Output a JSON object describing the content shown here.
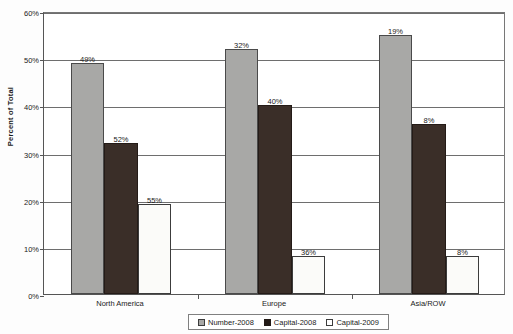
{
  "chart_data": {
    "type": "bar",
    "title": "",
    "subtitle": "",
    "xlabel": "",
    "ylabel": "Percent of Total",
    "categories": [
      "North America",
      "Europe",
      "Asia/ROW"
    ],
    "series": [
      {
        "name": "Number-2008",
        "values": [
          49,
          52,
          55
        ],
        "color": "#a8a8a6",
        "swatch": "gray-swatch"
      },
      {
        "name": "Capital-2008",
        "values": [
          32,
          40,
          36
        ],
        "color": "#3a2e28",
        "swatch": "black-swatch"
      },
      {
        "name": "Capital-2009",
        "values": [
          19,
          8,
          8
        ],
        "color": "#ffffff",
        "swatch": "white-swatch"
      }
    ],
    "grouped_values": {
      "North America": {
        "Number-2008": 49,
        "Capital-2008": 52,
        "Capital-2009": 55
      },
      "Europe": {
        "Number-2008": 32,
        "Capital-2008": 40,
        "Capital-2009": 36
      },
      "Asia/ROW": {
        "Number-2008": 19,
        "Capital-2008": 8,
        "Capital-2009": 8
      }
    },
    "data_labels": [
      [
        "49%",
        "52%",
        "55%"
      ],
      [
        "32%",
        "40%",
        "36%"
      ],
      [
        "19%",
        "8%",
        "8%"
      ]
    ],
    "ylim": [
      0,
      60
    ],
    "ytick_values": [
      0,
      10,
      20,
      30,
      40,
      50,
      60
    ],
    "ytick_labels": [
      "0%",
      "10%",
      "20%",
      "30%",
      "40%",
      "50%",
      "60%"
    ],
    "ytick_suffix": "%",
    "grid": "horizontal",
    "legend_position": "bottom-center",
    "legend_entries": [
      "Number-2008",
      "Capital-2008",
      "Capital-2009"
    ]
  }
}
